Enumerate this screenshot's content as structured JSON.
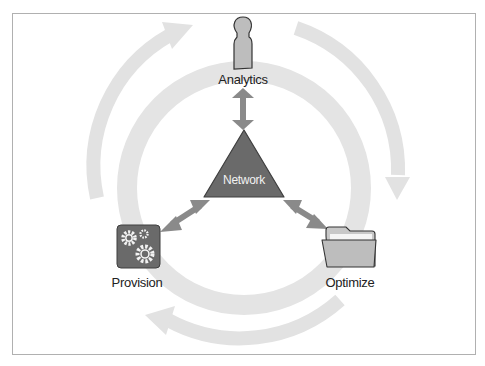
{
  "diagram": {
    "center": {
      "label": "Network",
      "shape": "triangle",
      "color": "#6a6a6a"
    },
    "nodes": [
      {
        "id": "analytics",
        "label": "Analytics",
        "icon": "person-icon"
      },
      {
        "id": "provision",
        "label": "Provision",
        "icon": "gears-icon"
      },
      {
        "id": "optimize",
        "label": "Optimize",
        "icon": "folder-icon"
      }
    ],
    "connectors": [
      {
        "from": "network",
        "to": "analytics",
        "type": "bidirectional-arrow"
      },
      {
        "from": "network",
        "to": "provision",
        "type": "bidirectional-arrow"
      },
      {
        "from": "network",
        "to": "optimize",
        "type": "bidirectional-arrow"
      }
    ],
    "cycle": {
      "direction": "clockwise",
      "ring_color": "#e3e3e3",
      "arrow_color": "#dcdcdc"
    },
    "colors": {
      "connector": "#8a8a8a",
      "icon_fill": "#bdbdbd",
      "icon_dark": "#6a6a6a"
    }
  }
}
